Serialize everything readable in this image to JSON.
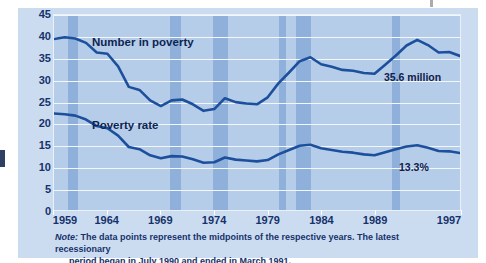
{
  "figure": {
    "background_color": "#ccdcf0",
    "plot_background_color": "#b6cdea",
    "line_color": "#1c4f9c",
    "recession_band_color": "#7fa5d4",
    "gridline_color": "#f2f7fc",
    "text_color": "#16326b"
  },
  "annotations": {
    "series1_label": "Number in poverty",
    "series2_label": "Poverty rate",
    "series1_value": "35.6 million",
    "series2_value": "13.3%"
  },
  "note": {
    "label": "Note:",
    "line1": " The data points represent the midpoints of the respective years. The latest recessionary",
    "line2": "period began in July 1990 and ended in March 1991."
  },
  "chart_data": {
    "type": "line",
    "title": "",
    "subtitle": "",
    "xlabel": "",
    "ylabel": "",
    "xlim": [
      1959,
      1997
    ],
    "ylim": [
      0,
      45
    ],
    "yticks": [
      0,
      5,
      10,
      15,
      20,
      25,
      30,
      35,
      40,
      45
    ],
    "xticks": [
      1959,
      1964,
      1969,
      1974,
      1979,
      1984,
      1989,
      1997
    ],
    "xtick_labels": [
      "1959",
      "1964",
      "1969",
      "1974",
      "1979",
      "1984",
      "1989",
      "1997"
    ],
    "ytick_labels": [
      "0",
      "5",
      "10",
      "15",
      "20",
      "25",
      "30",
      "35",
      "40",
      "45"
    ],
    "grid": true,
    "legend": "inline-labels",
    "x": [
      1959,
      1960,
      1961,
      1962,
      1963,
      1964,
      1965,
      1966,
      1967,
      1968,
      1969,
      1970,
      1971,
      1972,
      1973,
      1974,
      1975,
      1976,
      1977,
      1978,
      1979,
      1980,
      1981,
      1982,
      1983,
      1984,
      1985,
      1986,
      1987,
      1988,
      1989,
      1990,
      1991,
      1992,
      1993,
      1994,
      1995,
      1996,
      1997
    ],
    "series": [
      {
        "name": "Number in poverty",
        "units": "millions",
        "last_value": 35.6,
        "last_value_label": "35.6 million",
        "values": [
          39.5,
          39.9,
          39.6,
          38.6,
          36.4,
          36.1,
          33.2,
          28.5,
          27.8,
          25.4,
          24.1,
          25.4,
          25.6,
          24.5,
          23.0,
          23.4,
          25.9,
          25.0,
          24.7,
          24.5,
          26.1,
          29.3,
          31.8,
          34.4,
          35.3,
          33.7,
          33.1,
          32.4,
          32.2,
          31.7,
          31.5,
          33.6,
          35.7,
          38.0,
          39.3,
          38.1,
          36.4,
          36.5,
          35.6
        ]
      },
      {
        "name": "Poverty rate",
        "units": "percent",
        "last_value": 13.3,
        "last_value_label": "13.3%",
        "values": [
          22.4,
          22.2,
          21.9,
          21.0,
          19.5,
          19.0,
          17.3,
          14.7,
          14.2,
          12.8,
          12.1,
          12.6,
          12.5,
          11.9,
          11.1,
          11.2,
          12.3,
          11.8,
          11.6,
          11.4,
          11.7,
          13.0,
          14.0,
          15.0,
          15.2,
          14.4,
          14.0,
          13.6,
          13.4,
          13.0,
          12.8,
          13.5,
          14.2,
          14.8,
          15.1,
          14.5,
          13.8,
          13.7,
          13.3
        ]
      }
    ],
    "recession_bands": [
      {
        "start": 1960.3,
        "end": 1961.2
      },
      {
        "start": 1969.8,
        "end": 1970.8
      },
      {
        "start": 1973.8,
        "end": 1975.2
      },
      {
        "start": 1980.0,
        "end": 1980.6
      },
      {
        "start": 1981.5,
        "end": 1982.9
      },
      {
        "start": 1990.5,
        "end": 1991.2
      }
    ]
  }
}
